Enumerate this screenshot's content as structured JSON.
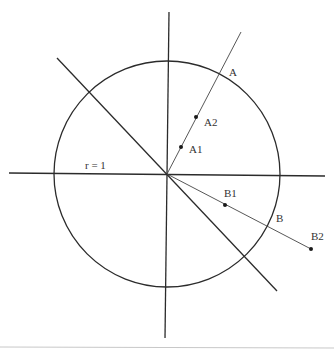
{
  "diagram": {
    "type": "unit-circle-geometry",
    "colors": {
      "stroke": "#2b2b2b",
      "thin_stroke": "#444444",
      "footer_line": "#c8c8c8",
      "label": "#333333"
    },
    "circle": {
      "cx": 167,
      "cy": 174,
      "r": 113,
      "label": "r = 1"
    },
    "axes": {
      "horizontal": {
        "x1": 9,
        "y1": 173,
        "x2": 325,
        "y2": 176
      },
      "vertical": {
        "x1": 169,
        "y1": 12,
        "x2": 165,
        "y2": 338
      }
    },
    "diagonal": {
      "x1": 57,
      "y1": 58,
      "x2": 277,
      "y2": 291
    },
    "rays": [
      {
        "name": "ray-a",
        "x1": 167,
        "y1": 174,
        "x2": 241,
        "y2": 32
      },
      {
        "name": "ray-b",
        "x1": 167,
        "y1": 174,
        "x2": 311,
        "y2": 249
      }
    ],
    "points": [
      {
        "id": "A1",
        "label": "A1",
        "x": 181,
        "y": 147,
        "lx": 189,
        "ly": 153,
        "dot": true
      },
      {
        "id": "A2",
        "label": "A2",
        "x": 196,
        "y": 117,
        "lx": 204,
        "ly": 126,
        "dot": true
      },
      {
        "id": "A",
        "label": "A",
        "x": 220,
        "y": 71,
        "lx": 229,
        "ly": 76,
        "dot": false
      },
      {
        "id": "B1",
        "label": "B1",
        "x": 225,
        "y": 205,
        "lx": 224,
        "ly": 197,
        "dot": true
      },
      {
        "id": "B",
        "label": "B",
        "x": 268,
        "y": 227,
        "lx": 276,
        "ly": 222,
        "dot": false
      },
      {
        "id": "B2",
        "label": "B2",
        "x": 311,
        "y": 249,
        "lx": 311,
        "ly": 240,
        "dot": true
      }
    ],
    "radius_label": {
      "text": "r = 1",
      "x": 85,
      "y": 169
    }
  }
}
